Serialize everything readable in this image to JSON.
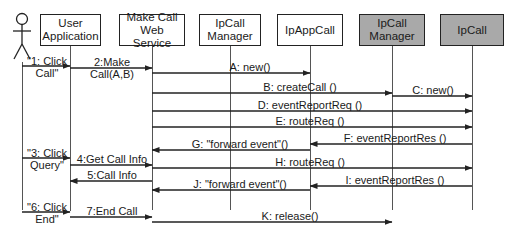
{
  "diagram": {
    "type": "sequence",
    "actor": {
      "name": "user-actor"
    },
    "participants": [
      {
        "id": "user_app",
        "label": "User\nApplication",
        "style": "white",
        "x": 70
      },
      {
        "id": "make_call_ws",
        "label": "Make Call\nWeb Service",
        "style": "white",
        "x": 152
      },
      {
        "id": "ipcall_manager_app",
        "label": "IpCall\nManager",
        "style": "white",
        "x": 230
      },
      {
        "id": "ipappcall",
        "label": "IpAppCall",
        "style": "white",
        "x": 310
      },
      {
        "id": "ipcall_manager_gw",
        "label": "IpCall\nManager",
        "style": "gray",
        "x": 392
      },
      {
        "id": "ipcall",
        "label": "IpCall",
        "style": "gray",
        "x": 472
      }
    ],
    "messages": [
      {
        "label": "\"1: Click\nCall\"",
        "from": "actor",
        "to": "user_app"
      },
      {
        "label": "2:Make Call(A,B)",
        "from": "user_app",
        "to": "make_call_ws"
      },
      {
        "label": "A: new()",
        "from": "make_call_ws",
        "to": "ipappcall"
      },
      {
        "label": "B: createCall ()",
        "from": "make_call_ws",
        "to": "ipcall_manager_gw"
      },
      {
        "label": "C: new()",
        "from": "ipcall_manager_gw",
        "to": "ipcall"
      },
      {
        "label": "D: eventReportReq  ()",
        "from": "make_call_ws",
        "to": "ipcall"
      },
      {
        "label": "E: routeReq ()",
        "from": "make_call_ws",
        "to": "ipcall"
      },
      {
        "label": "F: eventReportRes  ()",
        "from": "ipcall",
        "to": "ipappcall"
      },
      {
        "label": "G: \"forward event\"()",
        "from": "ipappcall",
        "to": "make_call_ws"
      },
      {
        "label": "\"3: Click\nQuery\"",
        "from": "actor",
        "to": "user_app"
      },
      {
        "label": "4:Get Call Info",
        "from": "user_app",
        "to": "make_call_ws"
      },
      {
        "label": "H: routeReq ()",
        "from": "make_call_ws",
        "to": "ipcall"
      },
      {
        "label": "5:Call Info",
        "from": "make_call_ws",
        "to": "user_app"
      },
      {
        "label": "I: eventReportRes  ()",
        "from": "ipcall",
        "to": "ipappcall"
      },
      {
        "label": "J: \"forward event\"()",
        "from": "ipappcall",
        "to": "make_call_ws"
      },
      {
        "label": "\"6: Click\nEnd\"",
        "from": "actor",
        "to": "user_app"
      },
      {
        "label": "7:End Call",
        "from": "user_app",
        "to": "make_call_ws"
      },
      {
        "label": "K: release()",
        "from": "make_call_ws",
        "to": "ipcall_manager_gw"
      }
    ]
  },
  "colors": {
    "line": "#222222",
    "gray_box": "#a9a9a9",
    "white_box": "#ffffff"
  }
}
